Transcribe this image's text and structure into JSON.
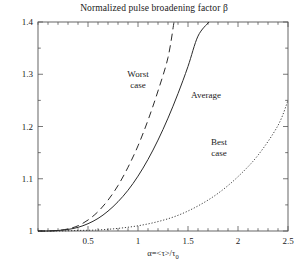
{
  "chart_data": {
    "type": "line",
    "title": "Normalized pulse broadening factor β",
    "xlabel": "α=<τ>/τ",
    "xlabel_sub": "0",
    "ylabel": "",
    "xlim": [
      0,
      2.5
    ],
    "ylim": [
      1.0,
      1.4
    ],
    "xticks": [
      "0.5",
      "1",
      "1.5",
      "2",
      "2.5"
    ],
    "xtick_values": [
      0.5,
      1,
      1.5,
      2,
      2.5
    ],
    "xminor_step": 0.1,
    "yticks": [
      "1",
      "1.1",
      "1.2",
      "1.3",
      "1.4"
    ],
    "ytick_values": [
      1,
      1.1,
      1.2,
      1.3,
      1.4
    ],
    "yminor_step": 0.05,
    "grid": false,
    "legend_position": "inline-annotations",
    "annotations": [
      {
        "id": "worst",
        "lines": [
          "Worst",
          "case"
        ],
        "x": 1.0,
        "y": 1.295
      },
      {
        "id": "average",
        "lines": [
          "Average"
        ],
        "x": 1.68,
        "y": 1.255
      },
      {
        "id": "best",
        "lines": [
          "Best",
          "case"
        ],
        "x": 1.81,
        "y": 1.165
      }
    ],
    "series": [
      {
        "name": "Worst case",
        "style": "dashed",
        "color": "#2b2b2b",
        "x": [
          0.0,
          0.1,
          0.2,
          0.3,
          0.4,
          0.5,
          0.6,
          0.7,
          0.8,
          0.9,
          1.0,
          1.1,
          1.2,
          1.3,
          1.36
        ],
        "y": [
          1.0,
          1.0,
          1.001,
          1.004,
          1.01,
          1.021,
          1.037,
          1.059,
          1.087,
          1.122,
          1.163,
          1.212,
          1.268,
          1.332,
          1.4
        ]
      },
      {
        "name": "Average",
        "style": "solid",
        "color": "#2b2b2b",
        "x": [
          0.0,
          0.1,
          0.2,
          0.3,
          0.4,
          0.5,
          0.6,
          0.7,
          0.8,
          0.9,
          1.0,
          1.1,
          1.2,
          1.3,
          1.4,
          1.5,
          1.6,
          1.71
        ],
        "y": [
          1.0,
          1.0,
          1.001,
          1.003,
          1.007,
          1.014,
          1.024,
          1.038,
          1.056,
          1.078,
          1.105,
          1.137,
          1.174,
          1.216,
          1.263,
          1.315,
          1.373,
          1.4
        ]
      },
      {
        "name": "Best case",
        "style": "dotted",
        "color": "#2b2b2b",
        "x": [
          0.0,
          0.2,
          0.4,
          0.6,
          0.8,
          1.0,
          1.2,
          1.4,
          1.6,
          1.8,
          2.0,
          2.2,
          2.4,
          2.5
        ],
        "y": [
          1.0,
          1.0,
          1.001,
          1.002,
          1.005,
          1.01,
          1.018,
          1.03,
          1.048,
          1.072,
          1.104,
          1.145,
          1.202,
          1.25
        ]
      }
    ]
  }
}
